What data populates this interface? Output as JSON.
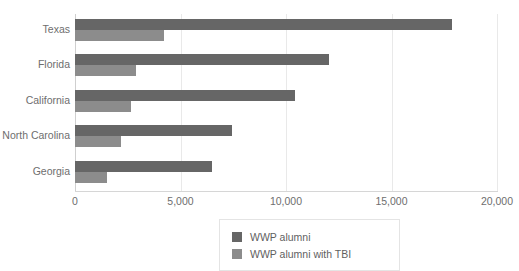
{
  "chart_data": {
    "type": "bar",
    "orientation": "horizontal",
    "title": "",
    "xlabel": "",
    "ylabel": "",
    "categories": [
      "Texas",
      "Florida",
      "California",
      "North Carolina",
      "Georgia"
    ],
    "series": [
      {
        "name": "WWP alumni",
        "color": "#666666",
        "values": [
          17870,
          12040,
          10430,
          7440,
          6490
        ]
      },
      {
        "name": "WWP alumni with TBI",
        "color": "#8c8c8c",
        "values": [
          4220,
          2890,
          2650,
          2180,
          1520
        ]
      }
    ],
    "xlim": [
      0,
      20000
    ],
    "xticks": [
      0,
      5000,
      10000,
      15000,
      20000
    ],
    "xtick_labels": [
      "0",
      "5,000",
      "10,000",
      "15,000",
      "20,000"
    ],
    "grid": true,
    "grid_axis": "x",
    "legend_position": "bottom-center"
  },
  "legend": {
    "items": [
      {
        "label": "WWP alumni",
        "swatch": "series-0"
      },
      {
        "label": "WWP alumni with TBI",
        "swatch": "series-1"
      }
    ]
  },
  "colors": {
    "series_0": "#666666",
    "series_1": "#8c8c8c",
    "gridline": "#e9e9e9",
    "axis": "#d6d6d6",
    "text": "#6e6e6e",
    "background": "#ffffff"
  }
}
